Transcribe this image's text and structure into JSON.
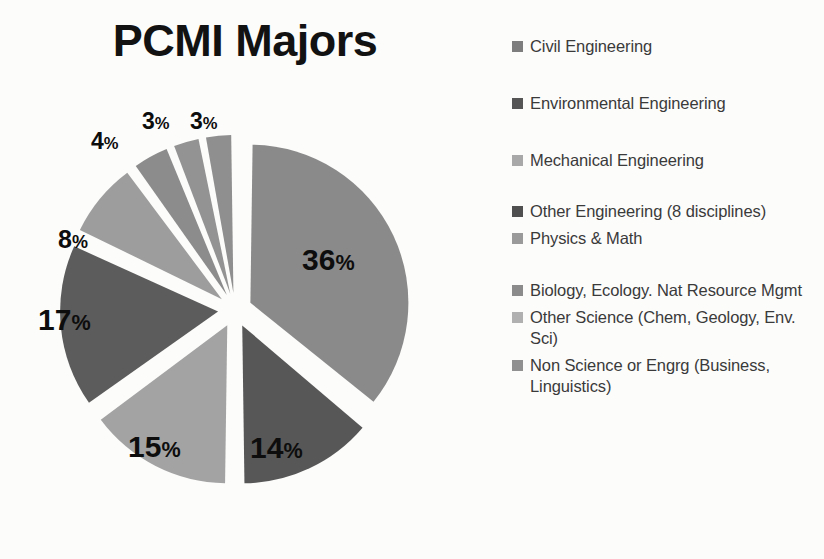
{
  "chart": {
    "title": "PCMI Majors"
  },
  "chart_data": {
    "type": "pie",
    "title": "PCMI Majors",
    "xlabel": "",
    "ylabel": "",
    "legend_position": "right",
    "grid": false,
    "exploded": true,
    "value_unit": "%",
    "categories": [
      "Civil Engineering",
      "Environmental Engineering",
      "Mechanical Engineering",
      "Other Engineering (8 disciplines)",
      "Physics & Math",
      "Biology, Ecology. Nat Resource Mgmt",
      "Other Science (Chem, Geology, Env. Sci)",
      "Non Science or Engrg (Business, Linguistics)"
    ],
    "values": [
      36,
      14,
      15,
      17,
      8,
      4,
      3,
      3
    ],
    "labels": [
      "36%",
      "14%",
      "15%",
      "17%",
      "8%",
      "4%",
      "3%",
      "3%"
    ],
    "colors": [
      "#8a8a8a",
      "#575757",
      "#a3a3a3",
      "#5c5c5c",
      "#9d9d9d",
      "#8c8c8c",
      "#939393",
      "#8f8f8f"
    ]
  },
  "legend": {
    "items": [
      {
        "label": "Civil Engineering",
        "color": "#7d7d7d"
      },
      {
        "label": "Environmental Engineering",
        "color": "#555555"
      },
      {
        "label": "Mechanical Engineering",
        "color": "#a8a8a8"
      },
      {
        "label": "Other Engineering (8 disciplines)",
        "color": "#4f4f4f"
      },
      {
        "label": "Physics & Math",
        "color": "#9a9a9a"
      },
      {
        "label": "Biology, Ecology. Nat Resource Mgmt",
        "color": "#8b8b8b"
      },
      {
        "label": "Other Science (Chem, Geology, Env. Sci)",
        "color": "#b0b0b0"
      },
      {
        "label": "Non Science or Engrg (Business, Linguistics)",
        "color": "#909090"
      }
    ]
  },
  "slice_labels": [
    {
      "value": "36",
      "suffix": "%",
      "left": "302",
      "top": "160",
      "size": "30"
    },
    {
      "value": "14",
      "suffix": "%",
      "left": "250",
      "top": "348",
      "size": "30"
    },
    {
      "value": "15",
      "suffix": "%",
      "left": "128",
      "top": "347",
      "size": "30"
    },
    {
      "value": "17",
      "suffix": "%",
      "left": "38",
      "top": "220",
      "size": "30"
    },
    {
      "value": "8",
      "suffix": "%",
      "left": "58",
      "top": "142",
      "size": "25"
    },
    {
      "value": "4",
      "suffix": "%",
      "left": "91",
      "top": "45",
      "size": "23"
    },
    {
      "value": "3",
      "suffix": "%",
      "left": "142",
      "top": "25",
      "size": "23"
    },
    {
      "value": "3",
      "suffix": "%",
      "left": "190",
      "top": "25",
      "size": "23"
    }
  ]
}
